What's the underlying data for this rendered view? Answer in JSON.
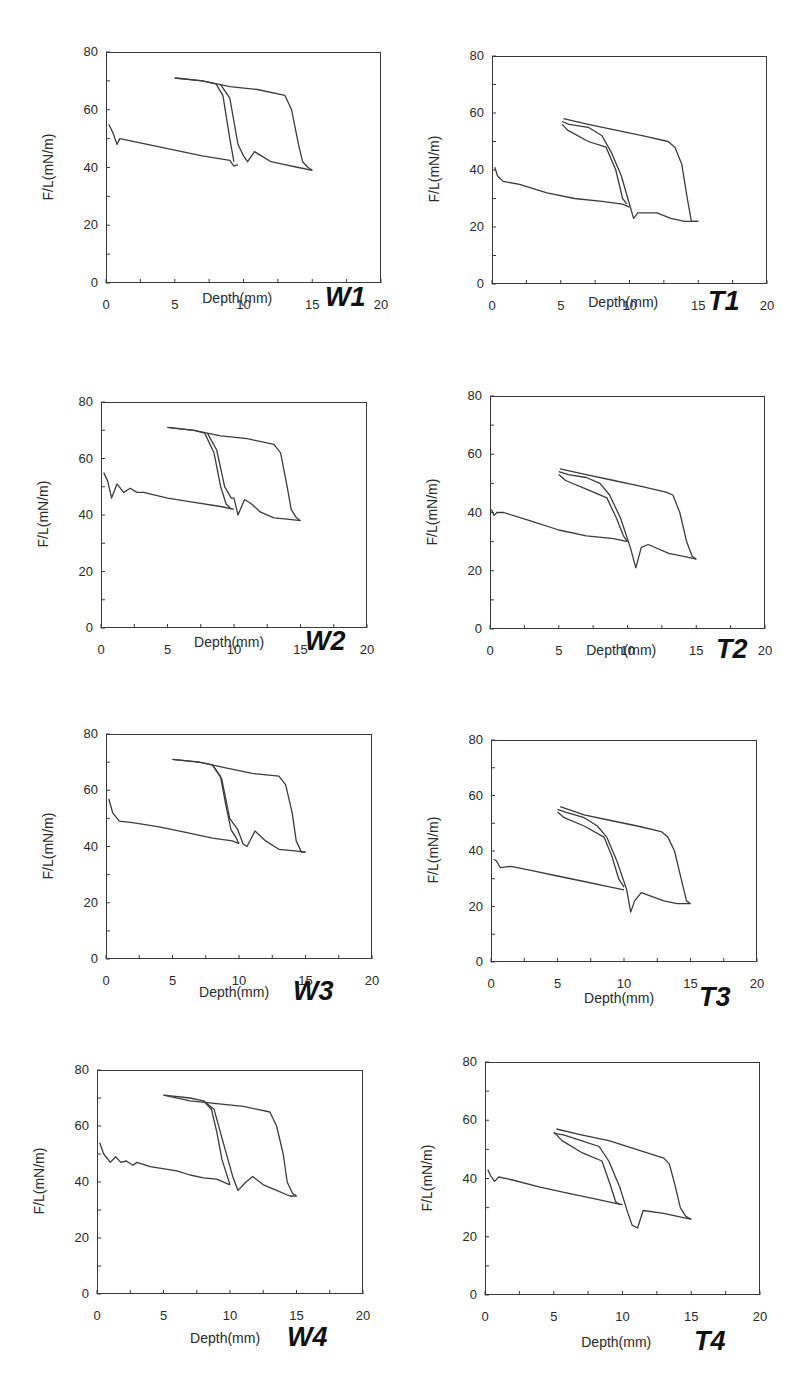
{
  "figure": {
    "line_color": "#3c3c3c",
    "axis_color": "#3a3a3a"
  },
  "chart_data": [
    {
      "id": "W1",
      "type": "line",
      "title": "W1",
      "xlabel": "Depth(mm)",
      "ylabel": "F/L(mN/m)",
      "xlim": [
        0,
        20
      ],
      "ylim": [
        0,
        80
      ],
      "xticks": [
        0,
        5,
        10,
        15,
        20
      ],
      "yticks": [
        0,
        20,
        40,
        60,
        80
      ],
      "series": [
        {
          "name": "curve-to-10mm",
          "x": [
            0.2,
            0.5,
            0.8,
            1.0,
            3,
            5,
            7,
            9,
            9.3,
            9.6
          ],
          "y": [
            55,
            52,
            48,
            50,
            48,
            46,
            44,
            42.5,
            40.5,
            41
          ]
        },
        {
          "name": "return-from-10mm",
          "x": [
            5,
            6,
            7,
            8,
            8.5,
            9,
            9.3
          ],
          "y": [
            71,
            70.5,
            70,
            69,
            65,
            50,
            42
          ]
        },
        {
          "name": "curve-return-2",
          "x": [
            8.3,
            9,
            9.6,
            9.8,
            10,
            10.3,
            10.8,
            11.3,
            12,
            13,
            14,
            15
          ],
          "y": [
            69,
            64,
            48,
            46,
            44,
            42,
            45.5,
            44,
            42,
            41,
            40,
            39
          ]
        },
        {
          "name": "return-from-15mm",
          "x": [
            5,
            7,
            9,
            11,
            13,
            13.5,
            14,
            14.3,
            14.7,
            15
          ],
          "y": [
            71,
            70,
            68,
            67,
            65,
            60,
            48,
            42,
            40,
            39
          ]
        }
      ]
    },
    {
      "id": "T1",
      "type": "line",
      "title": "T1",
      "xlabel": "Depth(mm)",
      "ylabel": "F/L(mN/m)",
      "xlim": [
        0,
        20
      ],
      "ylim": [
        0,
        80
      ],
      "xticks": [
        0,
        5,
        10,
        15,
        20
      ],
      "yticks": [
        0,
        20,
        40,
        60,
        80
      ],
      "series": [
        {
          "name": "curve-to-10mm",
          "x": [
            0.2,
            0.4,
            0.8,
            2,
            4,
            6,
            8,
            9.5,
            10
          ],
          "y": [
            41,
            38,
            36,
            35,
            32,
            30,
            29,
            28,
            27
          ]
        },
        {
          "name": "return-from-10mm",
          "x": [
            5.1,
            5.5,
            7,
            8.3,
            9,
            9.5,
            9.8
          ],
          "y": [
            56,
            54,
            50,
            48,
            40,
            30,
            28
          ]
        },
        {
          "name": "loop-mid",
          "x": [
            5.1,
            5.6,
            7,
            8,
            8.7,
            9.4,
            10,
            10.3,
            10.6,
            12,
            13,
            14,
            15
          ],
          "y": [
            57,
            56,
            55,
            52,
            46,
            38,
            28,
            23,
            25,
            25,
            23,
            22,
            22
          ]
        },
        {
          "name": "return-from-15mm",
          "x": [
            5.2,
            7,
            9,
            11,
            12.8,
            13.3,
            13.8,
            14.2,
            14.5,
            15
          ],
          "y": [
            58,
            56,
            54,
            52,
            50,
            48,
            42,
            30,
            22,
            22
          ]
        }
      ]
    },
    {
      "id": "W2",
      "type": "line",
      "title": "W2",
      "xlabel": "Depth(mm)",
      "ylabel": "F/L(mN/m)",
      "xlim": [
        0,
        20
      ],
      "ylim": [
        0,
        80
      ],
      "xticks": [
        0,
        5,
        10,
        15,
        20
      ],
      "yticks": [
        0,
        20,
        40,
        60,
        80
      ],
      "series": [
        {
          "name": "curve-to-10mm",
          "x": [
            0.2,
            0.5,
            0.8,
            1.2,
            1.7,
            2.2,
            2.7,
            3.2,
            5,
            7,
            9,
            10
          ],
          "y": [
            55,
            52,
            46,
            51,
            48,
            49.5,
            48,
            48,
            46,
            44.5,
            43,
            42
          ]
        },
        {
          "name": "return-from-10mm",
          "x": [
            5,
            7,
            7.8,
            8.5,
            9,
            9.4,
            9.8
          ],
          "y": [
            71,
            70,
            69,
            62,
            50,
            44,
            42
          ]
        },
        {
          "name": "curve-return-2",
          "x": [
            8,
            8.7,
            9.3,
            9.8,
            10,
            10.3,
            10.8,
            11.3,
            12,
            13,
            14,
            15
          ],
          "y": [
            69,
            63,
            50,
            46,
            46,
            40,
            45.5,
            44,
            41,
            39,
            38.5,
            38
          ]
        },
        {
          "name": "return-from-15mm",
          "x": [
            5,
            7,
            9,
            11,
            13,
            13.5,
            14,
            14.3,
            14.7,
            15
          ],
          "y": [
            71,
            70,
            68,
            67,
            65,
            62,
            50,
            42,
            39,
            38
          ]
        }
      ]
    },
    {
      "id": "T2",
      "type": "line",
      "title": "T2",
      "xlabel": "Depth(mm)",
      "ylabel": "F/L(mN/m)",
      "xlim": [
        0,
        20
      ],
      "ylim": [
        0,
        80
      ],
      "xticks": [
        0,
        5,
        10,
        15,
        20
      ],
      "yticks": [
        0,
        20,
        40,
        60,
        80
      ],
      "series": [
        {
          "name": "curve-to-10mm",
          "x": [
            0.1,
            0.3,
            0.5,
            1,
            3,
            5,
            7,
            9,
            10
          ],
          "y": [
            41,
            39,
            40,
            40,
            37,
            34,
            32,
            31,
            30
          ]
        },
        {
          "name": "return-from-10mm",
          "x": [
            5,
            5.5,
            7,
            8.5,
            9.2,
            9.7,
            10
          ],
          "y": [
            53,
            51,
            48,
            45,
            38,
            32,
            30
          ]
        },
        {
          "name": "loop-mid",
          "x": [
            5,
            5.7,
            7,
            8,
            8.7,
            9.5,
            10.2,
            10.6,
            11,
            11.5,
            13,
            14,
            15
          ],
          "y": [
            54,
            53,
            52,
            50,
            46,
            38,
            28,
            21,
            28,
            29,
            26,
            25,
            24
          ]
        },
        {
          "name": "return-from-15mm",
          "x": [
            5.1,
            7,
            9,
            11,
            12.8,
            13.3,
            13.8,
            14.3,
            14.7,
            15
          ],
          "y": [
            55,
            53,
            51,
            49,
            47,
            46,
            40,
            30,
            25,
            24
          ]
        }
      ]
    },
    {
      "id": "W3",
      "type": "line",
      "title": "W3",
      "xlabel": "Depth(mm)",
      "ylabel": "F/L(mN/m)",
      "xlim": [
        0,
        20
      ],
      "ylim": [
        0,
        80
      ],
      "xticks": [
        0,
        5,
        10,
        15,
        20
      ],
      "yticks": [
        0,
        20,
        40,
        60,
        80
      ],
      "series": [
        {
          "name": "curve-to-10mm",
          "x": [
            0.2,
            0.5,
            1,
            2,
            4,
            6,
            8,
            9.5,
            10
          ],
          "y": [
            57,
            52,
            49,
            48.5,
            47,
            45,
            43,
            42,
            41
          ]
        },
        {
          "name": "return-from-10mm",
          "x": [
            5,
            7,
            8,
            8.6,
            9,
            9.4,
            9.8,
            10
          ],
          "y": [
            71,
            70,
            69,
            65,
            55,
            46,
            43,
            41
          ]
        },
        {
          "name": "curve-return-2",
          "x": [
            8,
            8.7,
            9.3,
            9.9,
            10.3,
            10.6,
            11.2,
            12,
            13,
            14,
            15
          ],
          "y": [
            69,
            64,
            50,
            46,
            41,
            40,
            45.5,
            42,
            39,
            38.5,
            38
          ]
        },
        {
          "name": "return-from-15mm",
          "x": [
            5,
            7,
            9,
            11,
            13,
            13.5,
            14,
            14.3,
            14.7,
            15
          ],
          "y": [
            71,
            70,
            68,
            66,
            65,
            62,
            52,
            42,
            38,
            38
          ]
        }
      ]
    },
    {
      "id": "T3",
      "type": "line",
      "title": "T3",
      "xlabel": "Depth(mm)",
      "ylabel": "F/L(mN/m)",
      "xlim": [
        0,
        20
      ],
      "ylim": [
        0,
        80
      ],
      "xticks": [
        0,
        5,
        10,
        15,
        20
      ],
      "yticks": [
        0,
        20,
        40,
        60,
        80
      ],
      "series": [
        {
          "name": "curve-to-10mm",
          "x": [
            0.2,
            0.4,
            0.7,
            1.5,
            3,
            5,
            7,
            9,
            10
          ],
          "y": [
            37,
            36.5,
            34,
            34.5,
            33,
            31,
            29,
            27,
            26
          ]
        },
        {
          "name": "return-from-10mm",
          "x": [
            5,
            5.5,
            7,
            8.5,
            9.1,
            9.6,
            10
          ],
          "y": [
            54,
            52,
            49,
            45,
            38,
            30,
            27
          ]
        },
        {
          "name": "loop-mid",
          "x": [
            5,
            5.6,
            7,
            8,
            8.7,
            9.5,
            10.2,
            10.5,
            10.8,
            11.3,
            13,
            14,
            15
          ],
          "y": [
            55,
            54,
            52,
            49,
            45,
            36,
            26,
            18,
            22,
            25,
            22,
            21,
            21
          ]
        },
        {
          "name": "return-from-15mm",
          "x": [
            5.2,
            7,
            9,
            11,
            12.8,
            13.3,
            13.8,
            14.3,
            14.7,
            15
          ],
          "y": [
            56,
            53,
            51,
            49,
            47,
            45,
            40,
            30,
            22,
            21
          ]
        }
      ]
    },
    {
      "id": "W4",
      "type": "line",
      "title": "W4",
      "xlabel": "Depth(mm)",
      "ylabel": "F/L(mN/m)",
      "xlim": [
        0,
        20
      ],
      "ylim": [
        0,
        80
      ],
      "xticks": [
        0,
        5,
        10,
        15,
        20
      ],
      "yticks": [
        0,
        20,
        40,
        60,
        80
      ],
      "series": [
        {
          "name": "curve-to-10mm",
          "x": [
            0.2,
            0.5,
            1,
            1.4,
            1.8,
            2.2,
            2.7,
            3,
            4,
            6,
            7,
            8,
            9,
            10
          ],
          "y": [
            54,
            50,
            47,
            49,
            47,
            47.5,
            46,
            47,
            45.5,
            44,
            42.5,
            41.5,
            41,
            39
          ]
        },
        {
          "name": "return-from-10mm",
          "x": [
            5,
            7,
            8,
            8.6,
            9,
            9.4,
            9.8,
            10
          ],
          "y": [
            71,
            70,
            69,
            66,
            58,
            48,
            42,
            39
          ]
        },
        {
          "name": "curve-return-2",
          "x": [
            8,
            8.8,
            9.5,
            10.2,
            10.6,
            11.2,
            11.7,
            12.5,
            13.5,
            14.5,
            15
          ],
          "y": [
            69,
            66,
            54,
            42,
            37,
            40,
            42,
            39,
            37,
            35,
            35
          ]
        },
        {
          "name": "return-from-15mm",
          "x": [
            5,
            7,
            9,
            11,
            13,
            13.5,
            14,
            14.3,
            14.7,
            15
          ],
          "y": [
            71,
            69,
            68,
            67,
            65,
            60,
            50,
            40,
            36,
            35
          ]
        }
      ]
    },
    {
      "id": "T4",
      "type": "line",
      "title": "T4",
      "xlabel": "Depth(mm)",
      "ylabel": "F/L(mN/m)",
      "xlim": [
        0,
        20
      ],
      "ylim": [
        0,
        80
      ],
      "xticks": [
        0,
        5,
        10,
        15,
        20
      ],
      "yticks": [
        0,
        20,
        40,
        60,
        80
      ],
      "series": [
        {
          "name": "curve-to-10mm",
          "x": [
            0.2,
            0.4,
            0.7,
            1,
            2,
            4,
            6,
            8,
            9.5,
            10
          ],
          "y": [
            43,
            41,
            39,
            40.5,
            39.5,
            37,
            35,
            33,
            31.5,
            31
          ]
        },
        {
          "name": "return-from-10mm",
          "x": [
            5,
            5.6,
            7,
            8.5,
            9.1,
            9.5,
            9.8
          ],
          "y": [
            56,
            53,
            49,
            46,
            38,
            32,
            31
          ]
        },
        {
          "name": "loop-mid",
          "x": [
            5,
            5.7,
            7,
            8.3,
            9,
            9.8,
            10.4,
            10.7,
            11.1,
            11.5,
            13,
            14,
            15
          ],
          "y": [
            55.5,
            55,
            53,
            51,
            46,
            37,
            28,
            24,
            23,
            29,
            28,
            27,
            26
          ]
        },
        {
          "name": "return-from-15mm",
          "x": [
            5.2,
            7,
            9,
            11,
            13,
            13.4,
            13.8,
            14.2,
            14.6,
            15
          ],
          "y": [
            57,
            55,
            53,
            50,
            47,
            45,
            38,
            30,
            27,
            26
          ]
        }
      ]
    }
  ]
}
